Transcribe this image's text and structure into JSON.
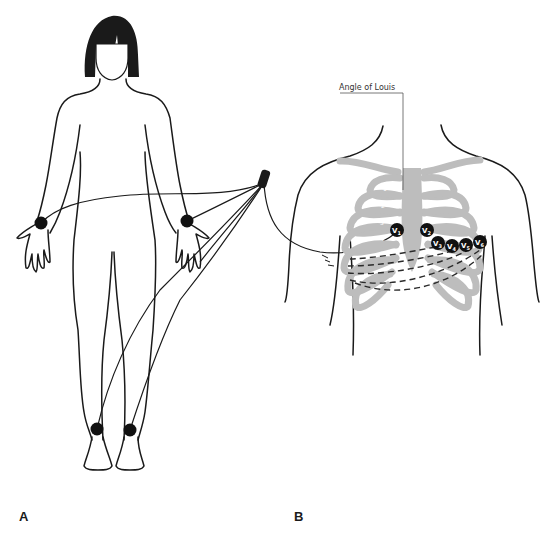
{
  "figure": {
    "panel_a": {
      "label": "A",
      "subject": "female figure standing, limb lead electrodes",
      "electrodes": [
        {
          "name": "right-wrist",
          "x": 41,
          "y": 223
        },
        {
          "name": "left-wrist",
          "x": 187,
          "y": 221
        },
        {
          "name": "right-ankle",
          "x": 97,
          "y": 429
        },
        {
          "name": "left-ankle",
          "x": 130,
          "y": 430
        }
      ],
      "lead_connector": {
        "x": 264,
        "y": 180
      }
    },
    "panel_b": {
      "label": "B",
      "callout": "Angle of Louis",
      "rib_numbers": [
        "1",
        "2",
        "3",
        "4",
        "5"
      ],
      "precordial_electrodes": [
        {
          "label": "V1",
          "main": "V",
          "sub": "1",
          "x": 397,
          "y": 230
        },
        {
          "label": "V2",
          "main": "V",
          "sub": "2",
          "x": 427,
          "y": 230
        },
        {
          "label": "V3",
          "main": "V",
          "sub": "3",
          "x": 438,
          "y": 243
        },
        {
          "label": "V4",
          "main": "V",
          "sub": "4",
          "x": 452,
          "y": 246
        },
        {
          "label": "V5",
          "main": "V",
          "sub": "5",
          "x": 466,
          "y": 245
        },
        {
          "label": "V6",
          "main": "V",
          "sub": "6",
          "x": 480,
          "y": 242
        }
      ]
    },
    "colors": {
      "line": "#1a1a1a",
      "bone": "#bdbdbd",
      "electrode": "#111111",
      "background": "#ffffff"
    }
  }
}
